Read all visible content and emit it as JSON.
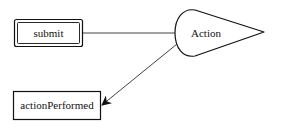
{
  "diagram": {
    "type": "flow",
    "nodes": [
      {
        "id": "submit",
        "label": "submit",
        "shape": "double-rect"
      },
      {
        "id": "action",
        "label": "Action",
        "shape": "teardrop"
      },
      {
        "id": "actionPerformed",
        "label": "actionPerformed",
        "shape": "rect"
      }
    ],
    "edges": [
      {
        "from": "submit",
        "to": "action",
        "arrow": false
      },
      {
        "from": "action",
        "to": "actionPerformed",
        "arrow": true
      }
    ],
    "colors": {
      "stroke": "#111111",
      "background": "#ffffff"
    }
  }
}
